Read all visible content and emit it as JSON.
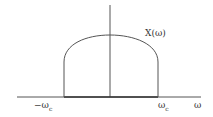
{
  "diagram": {
    "type": "spectrum-sketch",
    "function_label": "X(ω)",
    "axis_label": "ω",
    "left_cutoff": {
      "symbol": "−ω",
      "subscript": "c"
    },
    "right_cutoff": {
      "symbol": "ω",
      "subscript": "c"
    },
    "colors": {
      "line": "#555555",
      "baseline": "#333333"
    }
  }
}
